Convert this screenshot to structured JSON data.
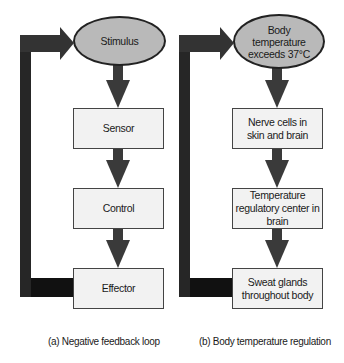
{
  "diagrams": [
    {
      "id": "a",
      "caption": "(a) Negative feedback loop",
      "start": "Stimulus",
      "steps": [
        "Sensor",
        "Control",
        "Effector"
      ]
    },
    {
      "id": "b",
      "caption": "(b) Body temperature regulation",
      "start": "Body temperature exceeds 37°C",
      "steps": [
        "Nerve cells in skin and brain",
        "Temperature regulatory center in brain",
        "Sweat glands throughout body"
      ]
    }
  ],
  "colors": {
    "ellipse_fill": "#b9b9b9",
    "box_fill": "#f2f2f2",
    "arrow": "#3a3a3a",
    "loop_bar": "#111111"
  }
}
